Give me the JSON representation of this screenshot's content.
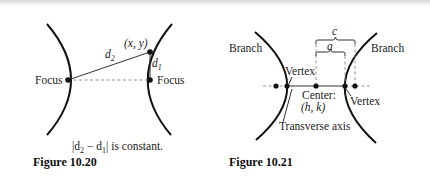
{
  "figure_10_20": {
    "caption": "Figure 10.20",
    "note_prefix": "|d",
    "note_sub2": "2",
    "note_minus": " − d",
    "note_sub1": "1",
    "note_suffix": "| is  constant.",
    "point_label": "(x, y)",
    "d2_label": "d",
    "d2_sub": "2",
    "d1_label": "d",
    "d1_sub": "1",
    "left_focus_label": "Focus",
    "right_focus_label": "Focus"
  },
  "figure_10_21": {
    "caption": "Figure 10.21",
    "left_branch_label": "Branch",
    "right_branch_label": "Branch",
    "left_vertex_label": "Vertex",
    "right_vertex_label": "Vertex",
    "center_label": "Center:",
    "center_coords": "(h, k)",
    "transverse_axis_label": "Transverse axis",
    "c_label": "c",
    "a_label": "a"
  },
  "colors": {
    "stroke": "#111111",
    "dashed": "#888888",
    "background": "#ffffff"
  }
}
